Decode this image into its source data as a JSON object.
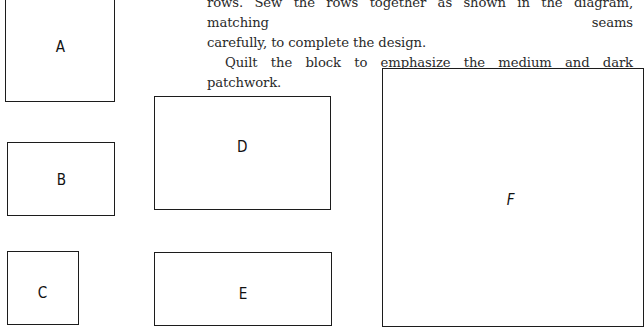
{
  "text": {
    "line1": "rows. Sew the rows together as shown in the diagram, matching seams",
    "line2": "carefully, to complete the design.",
    "paragraph2": "Quilt the block to emphasize the medium and dark patchwork."
  },
  "pieces": [
    {
      "label": "A"
    },
    {
      "label": "B"
    },
    {
      "label": "C"
    },
    {
      "label": "D"
    },
    {
      "label": "E"
    },
    {
      "label": "F"
    }
  ]
}
